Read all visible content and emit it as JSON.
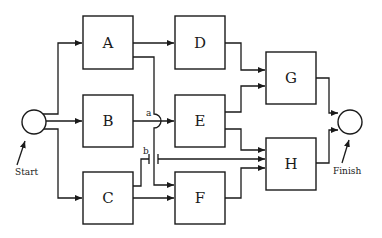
{
  "diagram": {
    "type": "activity-network",
    "nodes": [
      {
        "id": "start",
        "label": "Start",
        "shape": "circle"
      },
      {
        "id": "A",
        "label": "A",
        "shape": "box"
      },
      {
        "id": "B",
        "label": "B",
        "shape": "box"
      },
      {
        "id": "C",
        "label": "C",
        "shape": "box"
      },
      {
        "id": "D",
        "label": "D",
        "shape": "box"
      },
      {
        "id": "E",
        "label": "E",
        "shape": "box"
      },
      {
        "id": "F",
        "label": "F",
        "shape": "box"
      },
      {
        "id": "G",
        "label": "G",
        "shape": "box"
      },
      {
        "id": "H",
        "label": "H",
        "shape": "box"
      },
      {
        "id": "finish",
        "label": "Finish",
        "shape": "circle"
      }
    ],
    "edges": [
      {
        "from": "start",
        "to": "A"
      },
      {
        "from": "start",
        "to": "B"
      },
      {
        "from": "start",
        "to": "C"
      },
      {
        "from": "A",
        "to": "D"
      },
      {
        "from": "A",
        "to": "F",
        "note": "crosses B→E line at a"
      },
      {
        "from": "B",
        "to": "E"
      },
      {
        "from": "C",
        "to": "H",
        "note": "crosses A→F line at b"
      },
      {
        "from": "C",
        "to": "F"
      },
      {
        "from": "D",
        "to": "G"
      },
      {
        "from": "E",
        "to": "G"
      },
      {
        "from": "E",
        "to": "H"
      },
      {
        "from": "F",
        "to": "H"
      },
      {
        "from": "G",
        "to": "finish"
      },
      {
        "from": "H",
        "to": "finish"
      }
    ],
    "crossing_labels": {
      "a": "a",
      "b": "b"
    },
    "captions": {
      "start": "Start",
      "finish": "Finish"
    }
  }
}
